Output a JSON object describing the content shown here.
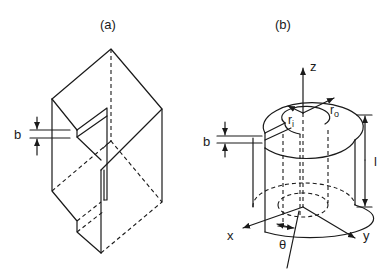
{
  "figure": {
    "panel_a": {
      "label": "(a)",
      "description": "rectangular block with slit",
      "dimension_label": "b"
    },
    "panel_b": {
      "label": "(b)",
      "description": "hollow cylinder with slit",
      "dimension_labels": {
        "slit_width": "b",
        "length": "l",
        "inner_radius": "r",
        "inner_radius_sub": "i",
        "outer_radius": "r",
        "outer_radius_sub": "o"
      },
      "axes": {
        "z": "z",
        "x": "x",
        "y": "y",
        "angle": "θ"
      }
    }
  }
}
